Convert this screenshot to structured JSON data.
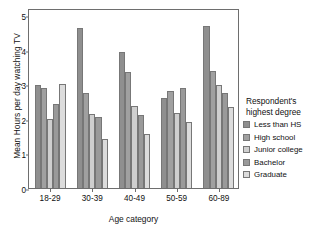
{
  "chart_data": {
    "type": "bar",
    "title": "",
    "xlabel": "Age category",
    "ylabel": "Mean Hours per day watching TV",
    "categories": [
      "18-29",
      "30-39",
      "40-49",
      "50-59",
      "60-89"
    ],
    "ylim": [
      0,
      5.2
    ],
    "yticks": [
      "0",
      "1",
      "2",
      "3",
      "4",
      "5"
    ],
    "ytick_values": [
      0,
      1,
      2,
      3,
      4,
      5
    ],
    "grid": false,
    "legend_position": "right",
    "legend_title_line1": "Respondent's",
    "legend_title_line2": "highest degree",
    "series": [
      {
        "name": "Less than HS",
        "color": "#8f8f8f",
        "values": [
          2.97,
          4.63,
          3.92,
          2.61,
          4.69
        ]
      },
      {
        "name": "High school",
        "color": "#a0a0a0",
        "values": [
          2.89,
          2.74,
          3.34,
          2.79,
          3.38
        ]
      },
      {
        "name": "Junior college",
        "color": "#cfcfcf",
        "values": [
          2.0,
          2.15,
          2.36,
          2.16,
          2.97
        ]
      },
      {
        "name": "Bachelor",
        "color": "#9a9a9a",
        "values": [
          2.43,
          2.04,
          2.1,
          2.89,
          2.75
        ]
      },
      {
        "name": "Graduate",
        "color": "#dcdcdc",
        "values": [
          3.0,
          1.43,
          1.55,
          1.9,
          2.33
        ]
      }
    ]
  },
  "axis": {
    "frame_color": "#6e6e6e"
  }
}
